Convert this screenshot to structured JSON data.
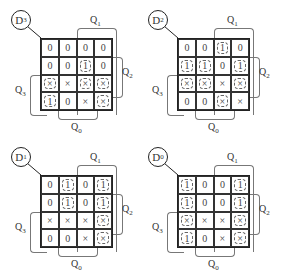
{
  "diagram": {
    "type": "karnaugh-maps",
    "maps": [
      {
        "id": "D3",
        "label": "D",
        "label_sub": "3",
        "cells": [
          [
            "0",
            "0",
            "0",
            "0"
          ],
          [
            "0",
            "0",
            "1",
            "0"
          ],
          [
            "×",
            "×",
            "×",
            "×"
          ],
          [
            "1",
            "0",
            "×",
            "×"
          ]
        ],
        "dashed_groups": [
          [
            1,
            2
          ],
          [
            2,
            2
          ],
          [
            2,
            0
          ],
          [
            3,
            0
          ],
          [
            2,
            3
          ],
          [
            3,
            3
          ]
        ]
      },
      {
        "id": "D2",
        "label": "D",
        "label_sub": "2",
        "cells": [
          [
            "0",
            "0",
            "1",
            "0"
          ],
          [
            "1",
            "1",
            "0",
            "1"
          ],
          [
            "×",
            "×",
            "×",
            "×"
          ],
          [
            "0",
            "0",
            "×",
            "×"
          ]
        ],
        "dashed_groups": [
          [
            0,
            2
          ],
          [
            1,
            0
          ],
          [
            1,
            1
          ],
          [
            2,
            0
          ],
          [
            2,
            1
          ],
          [
            1,
            3
          ],
          [
            2,
            3
          ],
          [
            3,
            2
          ]
        ]
      },
      {
        "id": "D1",
        "label": "D",
        "label_sub": "1",
        "cells": [
          [
            "0",
            "1",
            "0",
            "1"
          ],
          [
            "0",
            "1",
            "0",
            "1"
          ],
          [
            "×",
            "×",
            "×",
            "×"
          ],
          [
            "0",
            "0",
            "×",
            "×"
          ]
        ],
        "dashed_groups": [
          [
            0,
            1
          ],
          [
            1,
            1
          ],
          [
            0,
            3
          ],
          [
            1,
            3
          ],
          [
            2,
            3
          ],
          [
            3,
            3
          ]
        ]
      },
      {
        "id": "D0",
        "label": "D",
        "label_sub": "0",
        "cells": [
          [
            "1",
            "0",
            "0",
            "1"
          ],
          [
            "1",
            "0",
            "0",
            "1"
          ],
          [
            "×",
            "×",
            "×",
            "×"
          ],
          [
            "1",
            "0",
            "×",
            "×"
          ]
        ],
        "dashed_groups": [
          [
            0,
            0
          ],
          [
            1,
            0
          ],
          [
            2,
            0
          ],
          [
            3,
            0
          ],
          [
            0,
            3
          ],
          [
            1,
            3
          ],
          [
            2,
            3
          ],
          [
            3,
            3
          ]
        ]
      }
    ],
    "variable_labels": {
      "q1": {
        "text": "Q",
        "sub": "1"
      },
      "q2": {
        "text": "Q",
        "sub": "2"
      },
      "q3": {
        "text": "Q",
        "sub": "3"
      },
      "q0": {
        "text": "Q",
        "sub": "0"
      }
    }
  }
}
